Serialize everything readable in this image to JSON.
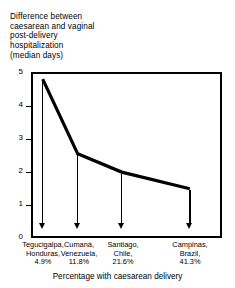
{
  "chart_data": {
    "type": "line",
    "title": "Difference between caesarean and vaginal post-delivery hospitalization (median days)",
    "title_lines": [
      "Difference between",
      "caesarean and vaginal",
      "post-delivery",
      "hospitalization",
      "(median days)"
    ],
    "xlabel": "Percentage with caesarean delivery",
    "ylabel": "Difference between caesarean and vaginal post-delivery hospitalization (median days)",
    "ylim": [
      0,
      5
    ],
    "yticks": [
      5,
      4,
      3,
      2,
      1,
      0
    ],
    "ytick_labels": [
      "5",
      "4",
      "3",
      "2",
      "1",
      "0"
    ],
    "grid": false,
    "legend": false,
    "x": [
      4.9,
      11.8,
      21.6,
      41.3
    ],
    "categories": [
      "Tegucigalpa, Honduras, 4.9%",
      "Cumaná, Venezuela, 11.8%",
      "Santiago, Chile, 21.6%",
      "Campinas, Brazil, 41.3%"
    ],
    "values": [
      4.8,
      2.55,
      2.0,
      1.5
    ],
    "points": [
      {
        "city": "Tegucigalpa",
        "country": "Honduras",
        "percent": "4.9%",
        "median_days": 4.8
      },
      {
        "city": "Cumaná",
        "country": "Venezuela",
        "percent": "11.8%",
        "median_days": 2.55
      },
      {
        "city": "Santiago",
        "country": "Chile",
        "percent": "21.6%",
        "median_days": 2.0
      },
      {
        "city": "Campinas",
        "country": "Brazil",
        "percent": "41.3%",
        "median_days": 1.5
      }
    ],
    "annotations": [
      {
        "name": "drop-arrow",
        "at_x": 4.9
      },
      {
        "name": "drop-arrow",
        "at_x": 11.8
      },
      {
        "name": "drop-arrow",
        "at_x": 21.6
      },
      {
        "name": "drop-arrow",
        "at_x": 41.3
      }
    ]
  },
  "labels": {
    "cities": [
      {
        "line1": "Tegucigalpa,",
        "line2": "Honduras,",
        "line3": "4.9%"
      },
      {
        "line1": "Cumaná,",
        "line2": "Venezuela,",
        "line3": "11.8%"
      },
      {
        "line1": "Santiago,",
        "line2": "Chile,",
        "line3": "21.6%"
      },
      {
        "line1": "Campinas,",
        "line2": "Brazil,",
        "line3": "41.3%"
      }
    ]
  },
  "style": {
    "line_color": "#000000",
    "axis_color": "#000000",
    "background": "#ffffff"
  }
}
